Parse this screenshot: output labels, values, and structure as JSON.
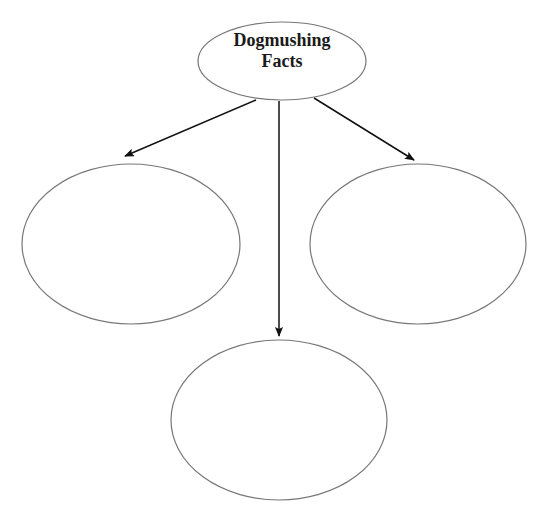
{
  "diagram": {
    "type": "web-organizer",
    "center_node": {
      "line1": "Dogmushing",
      "line2": "Facts"
    },
    "child_nodes": [
      {
        "position": "left",
        "text": ""
      },
      {
        "position": "bottom",
        "text": ""
      },
      {
        "position": "right",
        "text": ""
      }
    ],
    "colors": {
      "stroke": "#777777",
      "arrow": "#111111",
      "text": "#1a1a1a",
      "background": "#ffffff"
    }
  }
}
